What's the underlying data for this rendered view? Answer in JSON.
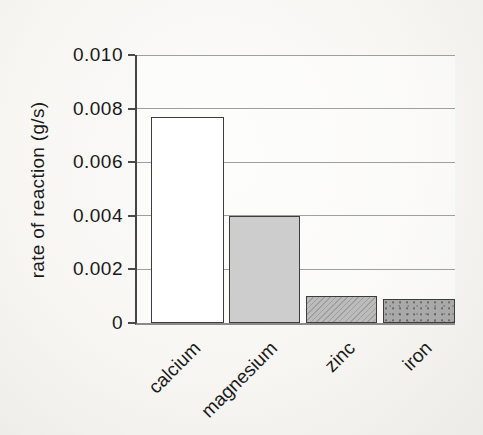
{
  "chart_data": {
    "type": "bar",
    "title": "",
    "xlabel": "",
    "ylabel": "rate of reaction (g/s)",
    "categories": [
      "calcium",
      "magnesium",
      "zinc",
      "iron"
    ],
    "values": [
      0.0077,
      0.004,
      0.001,
      0.0009
    ],
    "ylim": [
      0,
      0.01
    ],
    "ytick_labels": [
      "0.010",
      "0.008",
      "0.006",
      "0.004",
      "0.002",
      "0"
    ],
    "ytick_values": [
      0.01,
      0.008,
      0.006,
      0.004,
      0.002,
      0
    ],
    "grid": "horizontal",
    "legend": "none",
    "bar_styles": [
      {
        "category": "calcium",
        "fill": "#ffffff",
        "pattern": "plain"
      },
      {
        "category": "magnesium",
        "fill": "#cdcdcd",
        "pattern": "plain"
      },
      {
        "category": "zinc",
        "fill": "#bcbcbc",
        "pattern": "hatch"
      },
      {
        "category": "iron",
        "fill": "#a9a9a9",
        "pattern": "speckle"
      }
    ],
    "bar_border_color": "#3d3d3d",
    "axis_color": "#454545",
    "gridline_color": "#9f9f9f",
    "background_color": "#f7f6f3"
  }
}
